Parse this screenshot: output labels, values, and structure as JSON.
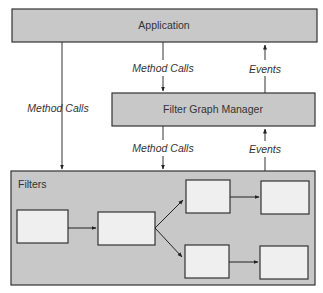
{
  "nodes": {
    "application": "Application",
    "filter_graph_manager": "Filter Graph Manager",
    "filters_container": "Filters"
  },
  "edges": {
    "app_to_filters": "Method Calls",
    "app_to_fgm": "Method Calls",
    "fgm_to_app": "Events",
    "fgm_to_filters": "Method Calls",
    "filters_to_fgm": "Events"
  },
  "colors": {
    "box_fill": "#c8c8c8",
    "filter_fill": "#efefef",
    "stroke": "#333333"
  }
}
